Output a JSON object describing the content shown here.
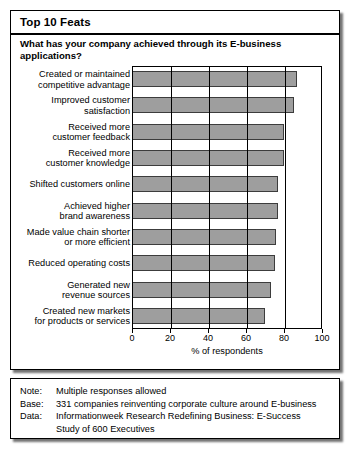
{
  "panel": {
    "title": "Top 10 Feats",
    "question": "What has your company achieved through its\nE-business applications?"
  },
  "chart_data": {
    "type": "bar",
    "orientation": "horizontal",
    "title": "Top 10 Feats",
    "subtitle": "What has your company achieved through its E-business applications?",
    "xlabel": "% of respondents",
    "ylabel": "",
    "xlim": [
      0,
      100
    ],
    "xticks": [
      0,
      20,
      40,
      60,
      80,
      100
    ],
    "grid": true,
    "legend": false,
    "bar_color": "#9e9e9e",
    "bar_border_color": "#3c3c3c",
    "categories": [
      "Created or maintained\ncompetitive advantage",
      "Improved customer\nsatisfaction",
      "Received more\ncustomer feedback",
      "Received more\ncustomer knowledge",
      "Shifted customers online",
      "Achieved higher\nbrand awareness",
      "Made value chain shorter\nor more efficient",
      "Reduced operating costs",
      "Generated new\nrevenue sources",
      "Created new markets\nfor products or services"
    ],
    "values": [
      87,
      85,
      80,
      80,
      77,
      77,
      76,
      75,
      73,
      70
    ]
  },
  "notes": [
    {
      "key": "Note:",
      "value": "Multiple responses allowed"
    },
    {
      "key": "Base:",
      "value": "331 companies reinventing corporate culture around E-business"
    },
    {
      "key": "Data:",
      "value": "Informationweek Research Redefining Business:  E-Success"
    }
  ],
  "notes_continuation": "Study of 600 Executives"
}
